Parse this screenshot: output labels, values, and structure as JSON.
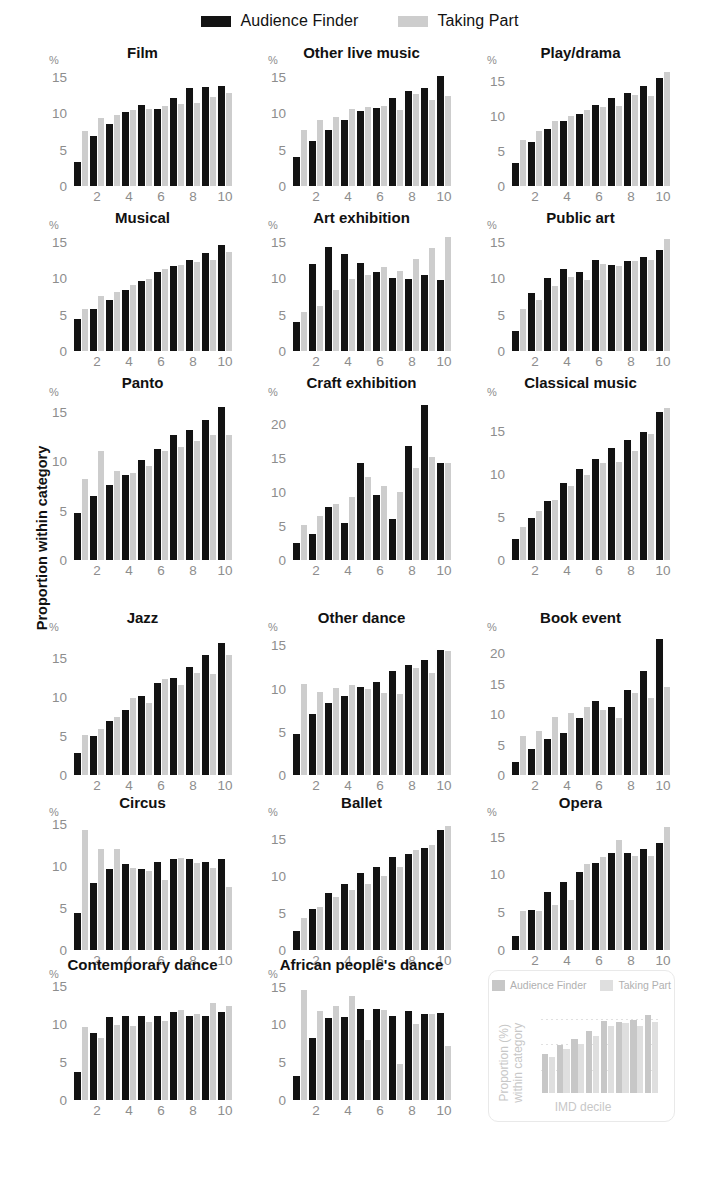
{
  "legend": {
    "items": [
      {
        "label": "Audience Finder",
        "color": "#131313"
      },
      {
        "label": "Taking Part",
        "color": "#cdcdcd"
      }
    ]
  },
  "axis_titles": {
    "y": "Proportion within category",
    "percent_symbol": "%"
  },
  "key_panel": {
    "legend": [
      {
        "label": "Audience Finder",
        "color": "#9b9b9b"
      },
      {
        "label": "Taking Part",
        "color": "#c6c6c6"
      }
    ],
    "ylabel": "Proportion (%)\nwithin category",
    "ylabel_line1": "Proportion (%)",
    "ylabel_line2": "within category",
    "xlabel": "IMD decile",
    "series_af": [
      6.0,
      7.4,
      8.4,
      9.6,
      11.2,
      11.1,
      11.3,
      12.2
    ],
    "series_tp": [
      5.6,
      6.8,
      7.7,
      8.9,
      10.4,
      10.9,
      10.5,
      11.1
    ]
  },
  "chart_data": [
    {
      "type": "bar",
      "title": "Film",
      "xlabel": "IMD decile",
      "ylabel": "Proportion within category",
      "categories": [
        1,
        2,
        3,
        4,
        5,
        6,
        7,
        8,
        9,
        10
      ],
      "yticks": [
        0,
        5,
        10,
        15
      ],
      "ylim": [
        0,
        16.2
      ],
      "series": [
        {
          "name": "Audience Finder",
          "values": [
            3.3,
            6.8,
            8.5,
            10.1,
            11.1,
            10.6,
            12.1,
            13.4,
            13.6,
            13.7
          ]
        },
        {
          "name": "Taking Part",
          "values": [
            7.6,
            9.4,
            9.8,
            10.4,
            10.6,
            11.0,
            11.2,
            11.4,
            12.2,
            12.8
          ]
        }
      ]
    },
    {
      "type": "bar",
      "title": "Other live music",
      "xlabel": "IMD decile",
      "ylabel": "Proportion within category",
      "categories": [
        1,
        2,
        3,
        4,
        5,
        6,
        7,
        8,
        9,
        10
      ],
      "yticks": [
        0,
        5,
        10,
        15
      ],
      "ylim": [
        0,
        16.2
      ],
      "series": [
        {
          "name": "Audience Finder",
          "values": [
            4.0,
            6.2,
            7.7,
            9.0,
            10.3,
            10.7,
            12.1,
            13.0,
            13.5,
            15.1
          ]
        },
        {
          "name": "Taking Part",
          "values": [
            7.7,
            9.0,
            9.5,
            10.6,
            10.9,
            11.0,
            10.4,
            12.6,
            11.8,
            12.4
          ]
        }
      ]
    },
    {
      "type": "bar",
      "title": "Play/drama",
      "xlabel": "IMD decile",
      "ylabel": "Proportion within category",
      "categories": [
        1,
        2,
        3,
        4,
        5,
        6,
        7,
        8,
        9,
        10
      ],
      "yticks": [
        0,
        5,
        10,
        15
      ],
      "ylim": [
        0,
        16.8
      ],
      "series": [
        {
          "name": "Audience Finder",
          "values": [
            3.3,
            6.2,
            8.1,
            9.3,
            10.3,
            11.6,
            12.6,
            13.2,
            14.3,
            15.4
          ]
        },
        {
          "name": "Taking Part",
          "values": [
            6.6,
            7.8,
            9.2,
            10.0,
            10.8,
            11.2,
            11.4,
            12.9,
            12.8,
            16.2
          ]
        }
      ]
    },
    {
      "type": "bar",
      "title": "Musical",
      "xlabel": "IMD decile",
      "ylabel": "Proportion within category",
      "categories": [
        1,
        2,
        3,
        4,
        5,
        6,
        7,
        8,
        9,
        10
      ],
      "yticks": [
        0,
        5,
        10,
        15
      ],
      "ylim": [
        0,
        16.2
      ],
      "series": [
        {
          "name": "Audience Finder",
          "values": [
            4.4,
            5.8,
            7.0,
            8.4,
            9.6,
            10.8,
            11.7,
            12.5,
            13.4,
            14.6
          ]
        },
        {
          "name": "Taking Part",
          "values": [
            5.8,
            7.6,
            8.1,
            9.0,
            9.9,
            11.2,
            11.8,
            12.2,
            12.5,
            13.6
          ]
        }
      ]
    },
    {
      "type": "bar",
      "title": "Art exhibition",
      "xlabel": "IMD decile",
      "ylabel": "Proportion within category",
      "categories": [
        1,
        2,
        3,
        4,
        5,
        6,
        7,
        8,
        9,
        10
      ],
      "yticks": [
        0,
        5,
        10,
        15
      ],
      "ylim": [
        0,
        16.2
      ],
      "series": [
        {
          "name": "Audience Finder",
          "values": [
            4.0,
            12.0,
            14.3,
            13.3,
            12.1,
            10.9,
            10.0,
            9.9,
            10.5,
            9.8
          ]
        },
        {
          "name": "Taking Part",
          "values": [
            5.4,
            6.2,
            8.4,
            9.9,
            10.5,
            11.6,
            11.0,
            12.7,
            14.1,
            15.6
          ]
        }
      ]
    },
    {
      "type": "bar",
      "title": "Public art",
      "xlabel": "IMD decile",
      "ylabel": "Proportion within category",
      "categories": [
        1,
        2,
        3,
        4,
        5,
        6,
        7,
        8,
        9,
        10
      ],
      "yticks": [
        0,
        5,
        10,
        15
      ],
      "ylim": [
        0,
        16.2
      ],
      "series": [
        {
          "name": "Audience Finder",
          "values": [
            2.7,
            8.0,
            10.0,
            11.3,
            10.9,
            12.5,
            11.8,
            12.4,
            12.9,
            13.9
          ]
        },
        {
          "name": "Taking Part",
          "values": [
            5.8,
            7.0,
            8.9,
            10.2,
            9.8,
            11.9,
            11.7,
            12.4,
            12.5,
            15.4
          ]
        }
      ]
    },
    {
      "type": "bar",
      "title": "Panto",
      "xlabel": "IMD decile",
      "ylabel": "Proportion within category",
      "categories": [
        1,
        2,
        3,
        4,
        5,
        6,
        7,
        8,
        9,
        10
      ],
      "yticks": [
        0,
        5,
        10,
        15
      ],
      "ylim": [
        0,
        16.2
      ],
      "series": [
        {
          "name": "Audience Finder",
          "values": [
            4.8,
            6.5,
            7.6,
            8.6,
            10.1,
            11.2,
            12.7,
            13.2,
            14.2,
            15.5
          ]
        },
        {
          "name": "Taking Part",
          "values": [
            8.2,
            11.0,
            9.0,
            8.8,
            9.5,
            11.0,
            11.4,
            12.1,
            12.7,
            12.7
          ]
        }
      ]
    },
    {
      "type": "bar",
      "title": "Craft exhibition",
      "xlabel": "IMD decile",
      "ylabel": "Proportion within category",
      "categories": [
        1,
        2,
        3,
        4,
        5,
        6,
        7,
        8,
        9,
        10
      ],
      "yticks": [
        0,
        5,
        10,
        15,
        20
      ],
      "ylim": [
        0,
        23.5
      ],
      "series": [
        {
          "name": "Audience Finder",
          "values": [
            2.5,
            3.8,
            7.8,
            5.5,
            14.3,
            9.6,
            6.0,
            16.7,
            22.8,
            14.3
          ]
        },
        {
          "name": "Taking Part",
          "values": [
            5.2,
            6.5,
            8.2,
            9.3,
            12.2,
            10.8,
            10.0,
            13.5,
            15.2,
            14.3
          ]
        }
      ]
    },
    {
      "type": "bar",
      "title": "Classical music",
      "xlabel": "IMD decile",
      "ylabel": "Proportion within category",
      "categories": [
        1,
        2,
        3,
        4,
        5,
        6,
        7,
        8,
        9,
        10
      ],
      "yticks": [
        0,
        5,
        10,
        15
      ],
      "ylim": [
        0,
        18.6
      ],
      "series": [
        {
          "name": "Audience Finder",
          "values": [
            2.5,
            4.9,
            6.9,
            8.9,
            10.6,
            11.7,
            13.0,
            14.0,
            14.9,
            17.2
          ]
        },
        {
          "name": "Taking Part",
          "values": [
            3.8,
            5.7,
            7.0,
            8.6,
            9.9,
            11.3,
            11.4,
            12.7,
            14.7,
            17.7
          ]
        }
      ]
    },
    {
      "type": "bar",
      "title": "Jazz",
      "xlabel": "IMD decile",
      "ylabel": "Proportion within category",
      "categories": [
        1,
        2,
        3,
        4,
        5,
        6,
        7,
        8,
        9,
        10
      ],
      "yticks": [
        0,
        5,
        10,
        15
      ],
      "ylim": [
        0,
        18.0
      ],
      "series": [
        {
          "name": "Audience Finder",
          "values": [
            2.8,
            5.0,
            6.9,
            8.4,
            10.1,
            11.8,
            12.5,
            13.9,
            15.4,
            17.0
          ]
        },
        {
          "name": "Taking Part",
          "values": [
            5.2,
            5.9,
            7.5,
            9.9,
            9.3,
            12.4,
            11.6,
            13.1,
            13.0,
            15.4
          ]
        }
      ]
    },
    {
      "type": "bar",
      "title": "Other dance",
      "xlabel": "IMD decile",
      "ylabel": "Proportion within category",
      "categories": [
        1,
        2,
        3,
        4,
        5,
        6,
        7,
        8,
        9,
        10
      ],
      "yticks": [
        0,
        5,
        10,
        15
      ],
      "ylim": [
        0,
        16.2
      ],
      "series": [
        {
          "name": "Audience Finder",
          "values": [
            4.8,
            7.1,
            8.3,
            9.2,
            10.2,
            10.8,
            12.0,
            12.7,
            13.3,
            14.5
          ]
        },
        {
          "name": "Taking Part",
          "values": [
            10.5,
            9.6,
            10.1,
            10.4,
            9.9,
            9.5,
            9.4,
            12.4,
            11.8,
            14.3
          ]
        }
      ]
    },
    {
      "type": "bar",
      "title": "Book event",
      "xlabel": "IMD decile",
      "ylabel": "Proportion within category",
      "categories": [
        1,
        2,
        3,
        4,
        5,
        6,
        7,
        8,
        9,
        10
      ],
      "yticks": [
        0,
        5,
        10,
        15,
        20
      ],
      "ylim": [
        0,
        23.0
      ],
      "series": [
        {
          "name": "Audience Finder",
          "values": [
            2.2,
            4.2,
            5.9,
            6.9,
            9.4,
            12.2,
            11.2,
            13.9,
            17.1,
            22.3
          ]
        },
        {
          "name": "Taking Part",
          "values": [
            6.4,
            7.2,
            9.5,
            10.2,
            11.1,
            10.6,
            9.4,
            13.5,
            12.6,
            14.4
          ]
        }
      ]
    },
    {
      "type": "bar",
      "title": "Circus",
      "xlabel": "IMD decile",
      "ylabel": "Proportion within category",
      "categories": [
        1,
        2,
        3,
        4,
        5,
        6,
        7,
        8,
        9,
        10
      ],
      "yticks": [
        0,
        5,
        10,
        15
      ],
      "ylim": [
        0,
        15.5
      ],
      "series": [
        {
          "name": "Audience Finder",
          "values": [
            4.4,
            8.0,
            9.7,
            10.2,
            9.7,
            10.5,
            10.8,
            10.9,
            10.5,
            10.9
          ]
        },
        {
          "name": "Taking Part",
          "values": [
            14.3,
            12.0,
            12.1,
            9.8,
            9.4,
            8.3,
            11.0,
            10.4,
            9.8,
            7.5
          ]
        }
      ]
    },
    {
      "type": "bar",
      "title": "Ballet",
      "xlabel": "IMD decile",
      "ylabel": "Proportion within category",
      "categories": [
        1,
        2,
        3,
        4,
        5,
        6,
        7,
        8,
        9,
        10
      ],
      "yticks": [
        0,
        5,
        10,
        15
      ],
      "ylim": [
        0,
        17.6
      ],
      "series": [
        {
          "name": "Audience Finder",
          "values": [
            2.6,
            5.6,
            7.7,
            9.0,
            10.4,
            11.2,
            12.6,
            13.0,
            13.8,
            16.2
          ]
        },
        {
          "name": "Taking Part",
          "values": [
            4.3,
            5.8,
            7.2,
            8.1,
            9.0,
            10.0,
            11.3,
            13.6,
            14.2,
            16.8
          ]
        }
      ]
    },
    {
      "type": "bar",
      "title": "Opera",
      "xlabel": "IMD decile",
      "ylabel": "Proportion within category",
      "categories": [
        1,
        2,
        3,
        4,
        5,
        6,
        7,
        8,
        9,
        10
      ],
      "yticks": [
        0,
        5,
        10,
        15
      ],
      "ylim": [
        0,
        17.2
      ],
      "series": [
        {
          "name": "Audience Finder",
          "values": [
            1.9,
            5.3,
            7.7,
            9.0,
            10.3,
            11.5,
            12.9,
            12.9,
            13.3,
            14.2
          ]
        },
        {
          "name": "Taking Part",
          "values": [
            5.2,
            5.2,
            6.0,
            6.6,
            11.4,
            12.3,
            14.5,
            12.5,
            12.5,
            16.3
          ]
        }
      ]
    },
    {
      "type": "bar",
      "title": "Contemporary dance",
      "xlabel": "IMD decile",
      "ylabel": "Proportion within category",
      "categories": [
        1,
        2,
        3,
        4,
        5,
        6,
        7,
        8,
        9,
        10
      ],
      "yticks": [
        0,
        5,
        10,
        15
      ],
      "ylim": [
        0,
        15.5
      ],
      "series": [
        {
          "name": "Audience Finder",
          "values": [
            3.7,
            8.8,
            10.9,
            11.0,
            11.1,
            11.0,
            11.5,
            11.1,
            11.1,
            11.6
          ]
        },
        {
          "name": "Taking Part",
          "values": [
            9.6,
            8.2,
            9.8,
            9.7,
            10.2,
            10.4,
            11.8,
            11.3,
            12.7,
            12.4
          ]
        }
      ]
    },
    {
      "type": "bar",
      "title": "African people's dance",
      "xlabel": "IMD decile",
      "ylabel": "Proportion within category",
      "categories": [
        1,
        2,
        3,
        4,
        5,
        6,
        7,
        8,
        9,
        10
      ],
      "yticks": [
        0,
        5,
        10,
        15
      ],
      "ylim": [
        0,
        15.6
      ],
      "series": [
        {
          "name": "Audience Finder",
          "values": [
            3.2,
            8.2,
            10.8,
            11.0,
            12.0,
            12.0,
            11.1,
            11.8,
            11.4,
            11.5
          ]
        },
        {
          "name": "Taking Part",
          "values": [
            14.6,
            11.8,
            12.4,
            13.8,
            7.9,
            11.9,
            4.7,
            10.0,
            11.4,
            7.2
          ]
        }
      ]
    }
  ],
  "layout": {
    "rows": [
      {
        "top": 0,
        "plot_h": 118,
        "title_y": 4,
        "plot_y": 28
      },
      {
        "top": 165,
        "plot_h": 118,
        "title_y": 4,
        "plot_y": 28
      },
      {
        "top": 330,
        "plot_h": 160,
        "title_y": 4,
        "plot_y": 30
      },
      {
        "top": 565,
        "plot_h": 140,
        "title_y": 4,
        "plot_y": 30
      },
      {
        "top": 750,
        "plot_h": 130,
        "title_y": 4,
        "plot_y": 30
      },
      {
        "top": 912,
        "plot_h": 118,
        "title_y": 4,
        "plot_y": 30
      }
    ],
    "cols": [
      0,
      219,
      438
    ]
  }
}
